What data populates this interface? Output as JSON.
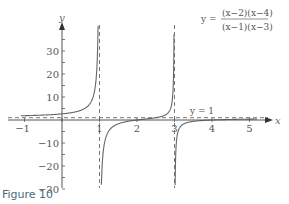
{
  "chart_data": {
    "type": "line",
    "title": "",
    "function": "y = (x-2)(x-4) / ((x-1)(x-3))",
    "formula": {
      "lhs": "y =",
      "numerator": "(x−2)(x−4)",
      "denominator": "(x−1)(x−3)"
    },
    "xlabel": "x",
    "ylabel": "y",
    "xlim": [
      -1.1,
      5.4
    ],
    "ylim": [
      -31,
      37
    ],
    "x_ticks": [
      -1,
      1,
      2,
      3,
      4,
      5
    ],
    "x_tick_labels": [
      "−1",
      "1",
      "2",
      "3",
      "4",
      "5"
    ],
    "x_minor_ticks": [
      -1,
      0,
      1,
      2,
      3,
      4,
      5
    ],
    "y_ticks": [
      30,
      20,
      10,
      -10,
      -20,
      -30
    ],
    "y_tick_labels": [
      "30",
      "20",
      "10",
      "−10",
      "−20",
      "−30"
    ],
    "y_minor_step": 5,
    "vertical_asymptotes": [
      1,
      3
    ],
    "horizontal_asymptote": {
      "y": 1,
      "label": "y = 1"
    },
    "grid": false,
    "legend": "none",
    "curve_color": "#666666",
    "asymptote_color": "#777777"
  },
  "caption": "Figure 10"
}
